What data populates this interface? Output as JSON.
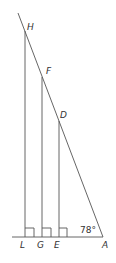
{
  "diagram": {
    "type": "geometry-similar-triangles",
    "points": {
      "H": {
        "label": "H"
      },
      "F": {
        "label": "F"
      },
      "D": {
        "label": "D"
      },
      "L": {
        "label": "L"
      },
      "G": {
        "label": "G"
      },
      "E": {
        "label": "E"
      },
      "A": {
        "label": "A"
      }
    },
    "angle_A": "78°",
    "right_angles": [
      "L",
      "G",
      "E"
    ],
    "stroke_color": "#555555"
  }
}
